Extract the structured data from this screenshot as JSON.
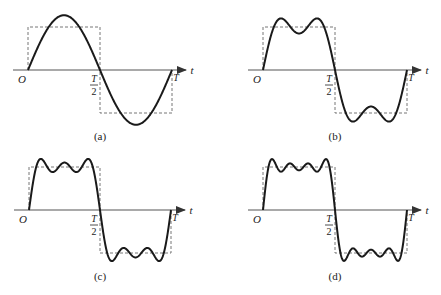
{
  "figure": {
    "panels": [
      {
        "id": "a",
        "caption": "(a)",
        "harmonics": [
          1
        ],
        "origin": {
          "x": 28,
          "y": 70
        },
        "half": 72,
        "amp": 43,
        "label_x": {
          "O": "O",
          "half_num": "T",
          "half_den": "2",
          "T": "T"
        },
        "axis_label": "t"
      },
      {
        "id": "b",
        "caption": "(b)",
        "harmonics": [
          1,
          3
        ],
        "origin": {
          "x": 263,
          "y": 70
        },
        "half": 72,
        "amp": 43,
        "label_x": {
          "O": "O",
          "half_num": "T",
          "half_den": "2",
          "T": "T"
        },
        "axis_label": "t"
      },
      {
        "id": "c",
        "caption": "(c)",
        "harmonics": [
          1,
          3,
          5
        ],
        "origin": {
          "x": 29,
          "y": 210
        },
        "half": 71,
        "amp": 43,
        "label_x": {
          "O": "O",
          "half_num": "T",
          "half_den": "2",
          "T": "T"
        },
        "axis_label": "t"
      },
      {
        "id": "d",
        "caption": "(d)",
        "harmonics": [
          1,
          3,
          5,
          7
        ],
        "origin": {
          "x": 263,
          "y": 210
        },
        "half": 72,
        "amp": 43,
        "label_x": {
          "O": "O",
          "half_num": "T",
          "half_den": "2",
          "T": "T"
        },
        "axis_label": "t"
      }
    ]
  },
  "colors": {
    "curve": "#1a1a1a",
    "axis": "#555555",
    "dashed": "#777777",
    "text": "#222222"
  }
}
